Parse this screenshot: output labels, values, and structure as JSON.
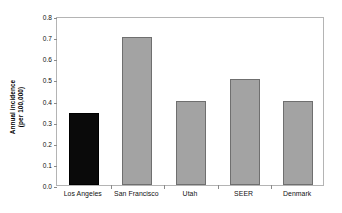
{
  "chart_data": {
    "type": "bar",
    "title": "",
    "subtitle": "",
    "xlabel": "",
    "ylabel": "Annual incidence (per 100,000)",
    "ylabel_lines": [
      "Annual incidence",
      "(per 100,000)"
    ],
    "categories": [
      "Los Angeles",
      "San Francisco",
      "Utah",
      "SEER",
      "Denmark"
    ],
    "values": [
      0.34,
      0.7,
      0.4,
      0.5,
      0.4
    ],
    "bar_colors": [
      "#0a0a0a",
      "#a3a3a3",
      "#a3a3a3",
      "#a3a3a3",
      "#a3a3a3"
    ],
    "ylim": [
      0.0,
      0.8
    ],
    "ytick_values": [
      0.0,
      0.1,
      0.2,
      0.3,
      0.4,
      0.5,
      0.6,
      0.7,
      0.8
    ],
    "ytick_labels": [
      "0.0",
      "0.1",
      "0.2",
      "0.3",
      "0.4",
      "0.5",
      "0.6",
      "0.7",
      "0.8"
    ],
    "grid": false,
    "legend": null,
    "legend_position": "none",
    "annotations": [],
    "frame_color": "#b4b4b4",
    "highlight_color": "#0a0a0a",
    "series_color": "#a3a3a3"
  }
}
